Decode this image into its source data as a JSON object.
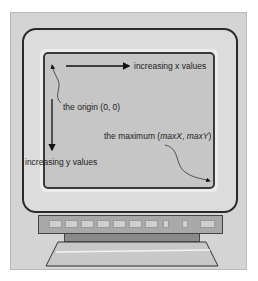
{
  "diagram": {
    "type": "screen-coordinate-system",
    "labels": {
      "x_axis": "increasing x values",
      "y_axis": "increasing y values",
      "origin": "the origin (0, 0)",
      "maximum_prefix": "the maximum (",
      "maximum_x": "maxX",
      "maximum_sep": ", ",
      "maximum_y": "maxY",
      "maximum_suffix": ")"
    },
    "monitor": {
      "front_buttons": 10
    },
    "colors": {
      "panel": "#d4d4d4",
      "screen": "#c6c6c6",
      "outline": "#2a2a2a",
      "button_bar": "#a9a9a9"
    }
  }
}
